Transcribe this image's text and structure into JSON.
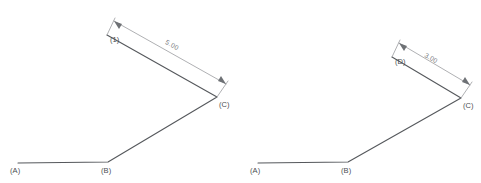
{
  "diagram": {
    "background_color": "#ffffff",
    "geometry_color": "#55585c",
    "dimension_color": "#9a9ca0",
    "label_color": "#4a4d51",
    "figures": [
      {
        "id": "left-figure",
        "vertices": [
          {
            "name": "A",
            "label": "(A)",
            "x": 18,
            "y": 163
          },
          {
            "name": "B",
            "label": "(B)",
            "x": 108,
            "y": 162
          },
          {
            "name": "C",
            "label": "(C)",
            "x": 217,
            "y": 97
          },
          {
            "name": "1",
            "label": "(1)",
            "x": 107,
            "y": 35
          }
        ],
        "dimension": {
          "value": "5.00",
          "from": "1",
          "to": "C",
          "text_x": 171,
          "text_y": 47
        }
      },
      {
        "id": "right-figure",
        "vertices": [
          {
            "name": "A",
            "label": "(A)",
            "x": 258,
            "y": 163
          },
          {
            "name": "B",
            "label": "(B)",
            "x": 348,
            "y": 162
          },
          {
            "name": "C",
            "label": "(C)",
            "x": 461,
            "y": 98
          },
          {
            "name": "D",
            "label": "(D)",
            "x": 392,
            "y": 57
          }
        ],
        "dimension": {
          "value": "3.00",
          "from": "D",
          "to": "C",
          "text_x": 430,
          "text_y": 60
        }
      }
    ]
  }
}
